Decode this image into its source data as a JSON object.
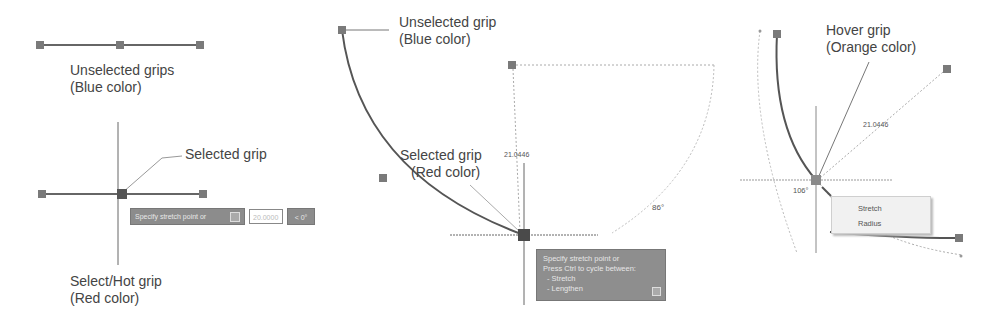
{
  "panel_line": {
    "unselected_label_1": "Unselected grips",
    "unselected_label_2": "(Blue color)",
    "selected_label": "Selected grip",
    "hot_label_1": "Select/Hot grip",
    "hot_label_2": "(Red color)",
    "tooltip": {
      "prompt": "Specify stretch point or",
      "input_value": "20.0000",
      "angle": "< 0°"
    }
  },
  "panel_arc": {
    "unselected_label_1": "Unselected grip",
    "unselected_label_2": "(Blue color)",
    "selected_label_1": "Selected grip",
    "selected_label_2": "(Red color)",
    "dimension_length": "21.0446",
    "dimension_angle": "86°",
    "tooltip": {
      "line_1": "Specify stretch point or",
      "line_2": "Press Ctrl to cycle between:",
      "line_3": "- Stretch",
      "line_4": "- Lengthen"
    }
  },
  "panel_hover": {
    "hover_label_1": "Hover grip",
    "hover_label_2": "(Orange color)",
    "dimension_length": "21.0446",
    "dimension_angle": "106°",
    "menu": {
      "items": [
        {
          "label": "Stretch"
        },
        {
          "label": "Radius"
        }
      ]
    }
  },
  "colors": {
    "grip_unselected": "#7a7a7a",
    "grip_selected": "#4a4a4a",
    "line": "#555555",
    "tooltip_bg": "#8c8c8c"
  }
}
